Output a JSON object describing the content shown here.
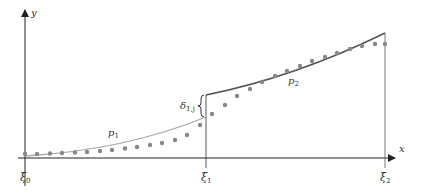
{
  "diagram": {
    "type": "piecewise-polynomial-approximation",
    "axes": {
      "x_label": "x",
      "y_label": "y"
    },
    "knots": [
      {
        "id": "xi0",
        "label": "ξ",
        "sub": "0",
        "px": 25
      },
      {
        "id": "xi1",
        "label": "ξ",
        "sub": "1",
        "px": 206
      },
      {
        "id": "xi2",
        "label": "ξ",
        "sub": "2",
        "px": 385
      }
    ],
    "curves": [
      {
        "id": "p1",
        "label": "p",
        "sub": "1",
        "color": "#aaaaaa",
        "interval": [
          "ξ0",
          "ξ1"
        ]
      },
      {
        "id": "p2",
        "label": "p",
        "sub": "2",
        "color": "#555555",
        "interval": [
          "ξ1",
          "ξ2"
        ]
      }
    ],
    "jump": {
      "label": "δ",
      "sub": "1,j",
      "at": "ξ1"
    },
    "data_points_color": "#888888",
    "data_points": [
      [
        25,
        154
      ],
      [
        37,
        154
      ],
      [
        50,
        153.5
      ],
      [
        62,
        153
      ],
      [
        75,
        152.5
      ],
      [
        87,
        152
      ],
      [
        100,
        151
      ],
      [
        112,
        150
      ],
      [
        125,
        148.5
      ],
      [
        137,
        147
      ],
      [
        150,
        145
      ],
      [
        162,
        143
      ],
      [
        175,
        140
      ],
      [
        187,
        135
      ],
      [
        200,
        125
      ],
      [
        212,
        114
      ],
      [
        225,
        105
      ],
      [
        237,
        96
      ],
      [
        250,
        89
      ],
      [
        262,
        82
      ],
      [
        275,
        76
      ],
      [
        287,
        71
      ],
      [
        300,
        66
      ],
      [
        312,
        61
      ],
      [
        325,
        57
      ],
      [
        337,
        53
      ],
      [
        350,
        49
      ],
      [
        362,
        46
      ],
      [
        375,
        44
      ],
      [
        385,
        44
      ]
    ]
  }
}
